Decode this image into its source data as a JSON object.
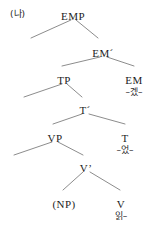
{
  "figure": {
    "label": "(나)",
    "line_color": "#6f6f6f",
    "text_color": "#1c1c1c"
  },
  "tree": {
    "nodes": [
      {
        "id": "EMP",
        "label": "EMP",
        "x": 73,
        "y": 11
      },
      {
        "id": "EMbar",
        "label": "EM",
        "prime": "´",
        "x": 103,
        "y": 48
      },
      {
        "id": "TP",
        "label": "TP",
        "x": 64,
        "y": 75
      },
      {
        "id": "EM",
        "label": "EM",
        "x": 134,
        "y": 75
      },
      {
        "id": "Tbar",
        "label": "T",
        "prime": "´",
        "x": 85,
        "y": 105
      },
      {
        "id": "VP",
        "label": "VP",
        "x": 55,
        "y": 133
      },
      {
        "id": "T",
        "label": "T",
        "x": 125,
        "y": 133
      },
      {
        "id": "Vbar",
        "label": "V",
        "prime": "’",
        "x": 86,
        "y": 163
      },
      {
        "id": "NP",
        "label": "(NP)",
        "x": 64,
        "y": 199
      },
      {
        "id": "V",
        "label": "V",
        "x": 121,
        "y": 199
      }
    ],
    "terminals": [
      {
        "parent": "EM",
        "text": "–겠–",
        "x": 134,
        "y": 88
      },
      {
        "parent": "T",
        "text": "–었–",
        "x": 125,
        "y": 146
      },
      {
        "parent": "V",
        "text": "읽–",
        "x": 121,
        "y": 212
      }
    ],
    "branches": [
      {
        "from": "EMP",
        "x1": 71,
        "y1": 20,
        "x2": 31,
        "y2": 38
      },
      {
        "from": "EMP",
        "x1": 76,
        "y1": 20,
        "x2": 98,
        "y2": 38
      },
      {
        "from": "EMbar",
        "x1": 100,
        "y1": 57,
        "x2": 62,
        "y2": 66
      },
      {
        "from": "EMbar",
        "x1": 107,
        "y1": 57,
        "x2": 134,
        "y2": 66
      },
      {
        "from": "TP",
        "x1": 62,
        "y1": 84,
        "x2": 24,
        "y2": 97
      },
      {
        "from": "TP",
        "x1": 67,
        "y1": 84,
        "x2": 82,
        "y2": 97
      },
      {
        "from": "Tbar",
        "x1": 82,
        "y1": 114,
        "x2": 53,
        "y2": 124
      },
      {
        "from": "Tbar",
        "x1": 89,
        "y1": 114,
        "x2": 125,
        "y2": 124
      },
      {
        "from": "VP",
        "x1": 52,
        "y1": 142,
        "x2": 14,
        "y2": 155
      },
      {
        "from": "VP",
        "x1": 58,
        "y1": 142,
        "x2": 83,
        "y2": 155
      },
      {
        "from": "Vbar",
        "x1": 83,
        "y1": 172,
        "x2": 63,
        "y2": 190
      },
      {
        "from": "Vbar",
        "x1": 90,
        "y1": 172,
        "x2": 120,
        "y2": 190
      }
    ]
  }
}
